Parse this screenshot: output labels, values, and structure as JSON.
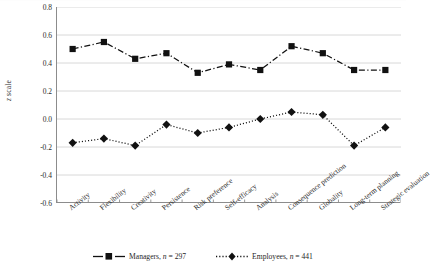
{
  "chart_data": {
    "type": "line",
    "title": "",
    "xlabel": "",
    "ylabel": "z scale",
    "ylim": [
      -0.6,
      0.8
    ],
    "ytick_labels": [
      "0.8",
      "0.6",
      "0.4",
      "0.2",
      "0.0",
      "-0.2",
      "-0.4",
      "-0.6"
    ],
    "ytick_values": [
      0.8,
      0.6,
      0.4,
      0.2,
      0.0,
      -0.2,
      -0.4,
      -0.6
    ],
    "grid": "horizontal",
    "legend_position": "bottom-center",
    "categories": [
      "Activity",
      "Flexibility",
      "Creativity",
      "Persistence",
      "Risk preference",
      "Self-efficacy",
      "Analysis",
      "Consequence prediction",
      "Globality",
      "Long-term planning",
      "Strategic evaluation"
    ],
    "series": [
      {
        "name": "Managers",
        "n": 297,
        "legend_label": "Managers, n = 297",
        "marker": "square",
        "line_style": "dash-dot",
        "color": "#111111",
        "values": [
          0.5,
          0.55,
          0.43,
          0.47,
          0.33,
          0.39,
          0.35,
          0.52,
          0.47,
          0.35,
          0.35
        ]
      },
      {
        "name": "Employees",
        "n": 441,
        "legend_label": "Employees, n = 441",
        "marker": "diamond",
        "line_style": "dotted",
        "color": "#111111",
        "values": [
          -0.17,
          -0.14,
          -0.19,
          -0.04,
          -0.1,
          -0.06,
          0.0,
          0.05,
          0.03,
          -0.19,
          -0.06
        ]
      }
    ]
  },
  "legend": {
    "managers_prefix": "Managers, ",
    "managers_n_italic": "n",
    "managers_suffix": " = 297",
    "employees_prefix": "Employees, ",
    "employees_n_italic": "n",
    "employees_suffix": " = 441"
  },
  "axis": {
    "y_title_italic": "z",
    "y_title_rest": " scale"
  }
}
